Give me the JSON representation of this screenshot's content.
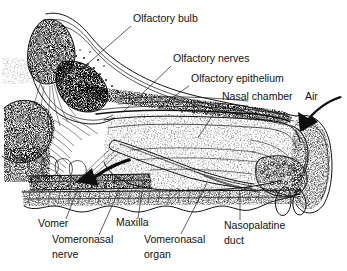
{
  "figure": {
    "background_color": "#ffffff",
    "ink_color": "#101010",
    "style": "black-and-white stippled line drawing"
  },
  "labels": [
    {
      "id": "olfactory-bulb",
      "text": "Olfactory bulb",
      "x": 133,
      "y": 22,
      "anchor": "start",
      "leader": "M 131 26 L 76 74"
    },
    {
      "id": "olfactory-nerves",
      "text": "Olfactory nerves",
      "x": 173,
      "y": 62,
      "anchor": "start",
      "leader": "M 171 66 L 123 112"
    },
    {
      "id": "olfactory-epithelium",
      "text": "Olfactory epithelium",
      "x": 191,
      "y": 82,
      "anchor": "start",
      "leader": "M 189 86 L 163 104"
    },
    {
      "id": "nasal-chamber",
      "text": "Nasal chamber",
      "x": 222,
      "y": 100,
      "anchor": "start",
      "leader": "M 220 104 L 198 138"
    },
    {
      "id": "air",
      "text": "Air",
      "x": 305,
      "y": 100,
      "anchor": "start",
      "leader": ""
    },
    {
      "id": "vomer",
      "text": "Vomer",
      "x": 38,
      "y": 227,
      "anchor": "start",
      "leader": "M 66 219 L 78 188"
    },
    {
      "id": "vomeronasal-nerve",
      "text": "Vomeronasal",
      "text2": "nerve",
      "x": 52,
      "y": 243,
      "y2": 258,
      "anchor": "start",
      "leader": "M 99 235 L 119 190"
    },
    {
      "id": "maxilla",
      "text": "Maxilla",
      "x": 116,
      "y": 226,
      "anchor": "start",
      "leader": "M 138 218 L 142 192"
    },
    {
      "id": "vomeronasal-organ",
      "text": "Vomeronasal",
      "text2": "organ",
      "x": 144,
      "y": 243,
      "y2": 258,
      "anchor": "start",
      "leader": "M 181 234 L 207 183"
    },
    {
      "id": "nasopalatine-duct",
      "text": "Nasopalatine",
      "text2": "duct",
      "x": 224,
      "y": 229,
      "y2": 244,
      "anchor": "start",
      "leader": "M 240 220 L 240 193"
    }
  ],
  "arrows": [
    {
      "id": "air-inflow-arrow",
      "description": "thick curved black arrow entering the nostril from upper right, pointing down-left",
      "color": "#0d0d0d"
    },
    {
      "id": "vomeronasal-flow-arrow",
      "description": "thick curved black arrow in lower left pointing down-left toward vomer region",
      "color": "#0d0d0d"
    }
  ],
  "structures": [
    {
      "id": "olfactory-bulb-mass",
      "description": "oval fibrous mass at upper left with radiating striations"
    },
    {
      "id": "cribriform-plate",
      "description": "perforated bony plate between bulb and nasal chamber, stippled with pores"
    },
    {
      "id": "olfactory-nerve-bundle",
      "description": "fan of fine fibers crossing cribriform plate"
    },
    {
      "id": "nasal-chamber-cavity",
      "description": "large stippled chamber spanning center to right of figure"
    },
    {
      "id": "olfactory-epithelium-lining",
      "description": "narrow dark band lining roof of nasal chamber"
    },
    {
      "id": "vomeronasal-organ-tube",
      "description": "elongated tubular organ in lower center with paired outlines"
    },
    {
      "id": "vomer-bone",
      "description": "horizontal bony layer at lower left"
    },
    {
      "id": "maxilla-bone",
      "description": "hatched horizontal bone plate along lower margin with scalloped edge"
    },
    {
      "id": "nasopalatine-duct-opening",
      "description": "duct with cluster of round glandular profiles near right lower area"
    },
    {
      "id": "nostril",
      "description": "external nostril opening at far right with cartilage flap"
    }
  ]
}
